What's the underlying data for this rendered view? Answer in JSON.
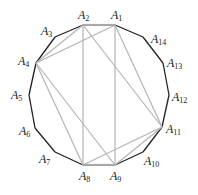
{
  "diagram": {
    "type": "regular-polygon-with-chords",
    "vertex_count": 14,
    "vertices": [
      {
        "id": "A1",
        "letter": "A",
        "index": "1"
      },
      {
        "id": "A2",
        "letter": "A",
        "index": "2"
      },
      {
        "id": "A3",
        "letter": "A",
        "index": "3"
      },
      {
        "id": "A4",
        "letter": "A",
        "index": "4"
      },
      {
        "id": "A5",
        "letter": "A",
        "index": "5"
      },
      {
        "id": "A6",
        "letter": "A",
        "index": "6"
      },
      {
        "id": "A7",
        "letter": "A",
        "index": "7"
      },
      {
        "id": "A8",
        "letter": "A",
        "index": "8"
      },
      {
        "id": "A9",
        "letter": "A",
        "index": "9"
      },
      {
        "id": "A10",
        "letter": "A",
        "index": "10"
      },
      {
        "id": "A11",
        "letter": "A",
        "index": "11"
      },
      {
        "id": "A12",
        "letter": "A",
        "index": "12"
      },
      {
        "id": "A13",
        "letter": "A",
        "index": "13"
      },
      {
        "id": "A14",
        "letter": "A",
        "index": "14"
      }
    ],
    "highlighted_edges": [
      [
        "A1",
        "A2"
      ],
      [
        "A8",
        "A9"
      ]
    ],
    "chords": [
      [
        "A1",
        "A4"
      ],
      [
        "A2",
        "A4"
      ],
      [
        "A2",
        "A8"
      ],
      [
        "A1",
        "A9"
      ],
      [
        "A2",
        "A11"
      ],
      [
        "A1",
        "A11"
      ],
      [
        "A4",
        "A8"
      ],
      [
        "A4",
        "A9"
      ],
      [
        "A8",
        "A11"
      ],
      [
        "A9",
        "A11"
      ]
    ],
    "colors": {
      "polygon_edge": "#222222",
      "chord": "#b4b4b4",
      "highlighted_edge": "#a8a8a8"
    }
  }
}
